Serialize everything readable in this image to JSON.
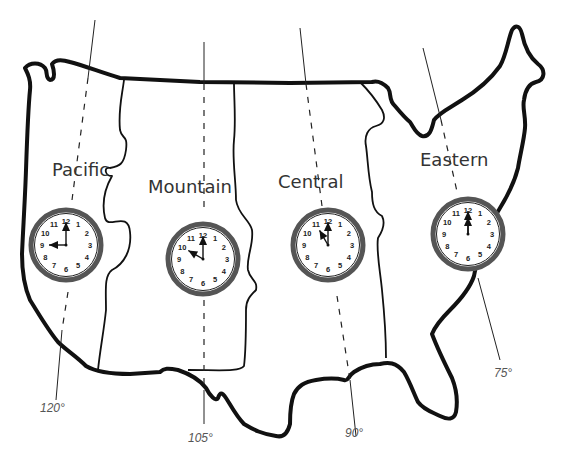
{
  "zones": [
    {
      "name": "Pacific",
      "time": "9:00",
      "hour": 9,
      "minute": 0,
      "meridian": "120°"
    },
    {
      "name": "Mountain",
      "time": "10:00",
      "hour": 10,
      "minute": 0,
      "meridian": "105°"
    },
    {
      "name": "Central",
      "time": "11:00",
      "hour": 11,
      "minute": 0,
      "meridian": "90°"
    },
    {
      "name": "Eastern",
      "time": "12:00",
      "hour": 12,
      "minute": 0,
      "meridian": "75°"
    }
  ],
  "clock_numbers": [
    "12",
    "1",
    "2",
    "3",
    "4",
    "5",
    "6",
    "7",
    "8",
    "9",
    "10",
    "11"
  ],
  "colors": {
    "outline": "#111111",
    "clock_ring": "#555555",
    "label_text": "#333333"
  }
}
